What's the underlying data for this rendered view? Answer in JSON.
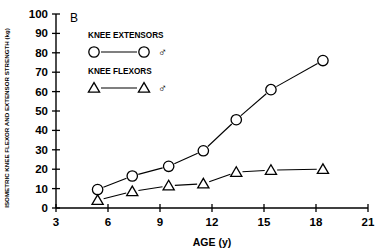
{
  "panel_label": "B",
  "axes": {
    "x_label": "AGE (y)",
    "y_label": "ISOMETRIC KNEE FLEXOR AND EXTENSOR STRENGTH (kg)",
    "x_ticks": [
      "3",
      "6",
      "9",
      "12",
      "15",
      "18",
      "21"
    ],
    "y_ticks": [
      "0",
      "10",
      "20",
      "30",
      "40",
      "50",
      "60",
      "70",
      "80",
      "90",
      "100"
    ]
  },
  "legend": {
    "entries": [
      {
        "title": "KNEE EXTENSORS",
        "marker": "circle",
        "sex_symbol": "♂"
      },
      {
        "title": "KNEE FLEXORS",
        "marker": "triangle",
        "sex_symbol": "♂"
      }
    ]
  },
  "chart_data": {
    "type": "line",
    "title": "",
    "xlabel": "AGE (y)",
    "ylabel": "ISOMETRIC KNEE FLEXOR AND EXTENSOR STRENGTH (kg)",
    "xlim": [
      3,
      21
    ],
    "ylim": [
      0,
      100
    ],
    "xticks": [
      3,
      6,
      9,
      12,
      15,
      18,
      21
    ],
    "yticks": [
      0,
      10,
      20,
      30,
      40,
      50,
      60,
      70,
      80,
      90,
      100
    ],
    "grid": false,
    "legend_position": "upper-left-inside",
    "series": [
      {
        "name": "KNEE EXTENSORS ♂",
        "marker": "circle",
        "color": "#000000",
        "x": [
          5.4,
          7.4,
          9.5,
          11.5,
          13.4,
          15.4,
          18.4
        ],
        "y": [
          9.5,
          16.5,
          21.5,
          29.5,
          45.5,
          61,
          76
        ]
      },
      {
        "name": "KNEE FLEXORS ♂",
        "marker": "triangle",
        "color": "#000000",
        "x": [
          5.4,
          7.4,
          9.5,
          11.5,
          13.4,
          15.4,
          18.4
        ],
        "y": [
          4,
          8.5,
          11.5,
          12.5,
          18.5,
          19.5,
          20
        ]
      }
    ]
  }
}
